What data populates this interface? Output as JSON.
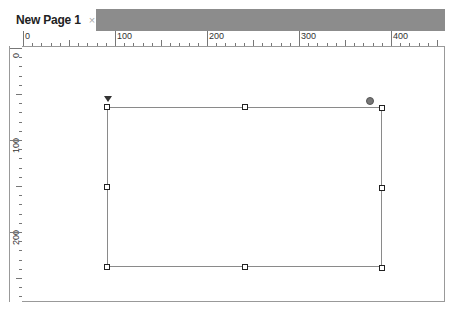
{
  "tabs": [
    {
      "label": "New Page 1",
      "close_icon": "×",
      "active": true
    }
  ],
  "ruler": {
    "horizontal_labels": [
      "0",
      "100",
      "200",
      "300",
      "400"
    ],
    "vertical_labels": [
      "0",
      "100",
      "200"
    ],
    "units_per_label": 100
  },
  "canvas": {
    "shape": {
      "type": "rectangle",
      "selected": true,
      "handles": 8,
      "rotation_handle": true,
      "anchor_marker": true
    }
  },
  "colors": {
    "tabbar_background": "#8c8c8c",
    "ruler_border": "#999999",
    "shape_border": "#8a8a8a",
    "handle_border": "#222222"
  }
}
